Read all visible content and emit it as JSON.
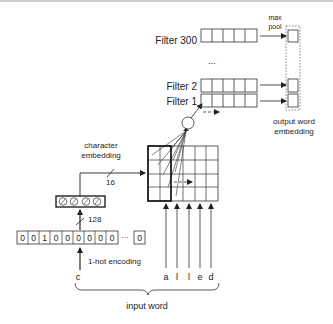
{
  "diagram": {
    "filters": {
      "filter_300": "Filter 300",
      "ellipsis": "...",
      "filter_2": "Filter 2",
      "filter_1": "Filter 1"
    },
    "max_pool": {
      "line1": "max",
      "line2": "pool"
    },
    "output": {
      "line1": "output word",
      "line2": "embedding"
    },
    "char_embedding": {
      "line1": "character",
      "line2": "embedding",
      "dim": "16"
    },
    "onehot": {
      "dim": "128",
      "cells": [
        "0",
        "0",
        "1",
        "0",
        "0",
        "0",
        "0",
        "0",
        "0"
      ],
      "ellipsis": "···",
      "last": "0",
      "label": "1-hot encoding"
    },
    "input_char": "c",
    "input_letters": [
      "a",
      "l",
      "l",
      "e",
      "d"
    ],
    "input_word_label": "input word"
  }
}
